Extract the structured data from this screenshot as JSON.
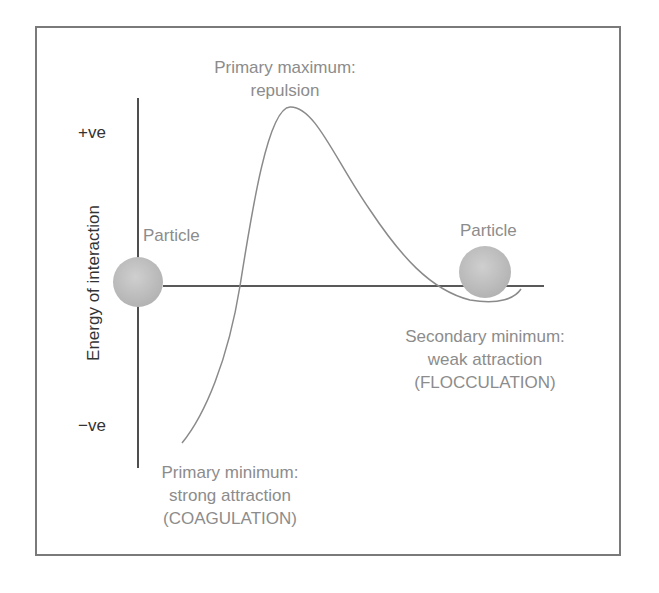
{
  "diagram": {
    "y_axis": {
      "label": "Energy of interaction",
      "top_label": "+ve",
      "bottom_label": "−ve"
    },
    "annotations": {
      "primary_maximum": [
        "Primary maximum:",
        "repulsion"
      ],
      "primary_minimum": [
        "Primary minimum:",
        "strong attraction",
        "(COAGULATION)"
      ],
      "secondary_minimum": [
        "Secondary minimum:",
        "weak attraction",
        "(FLOCCULATION)"
      ]
    },
    "particles": [
      {
        "label": "Particle",
        "position": "left"
      },
      {
        "label": "Particle",
        "position": "right"
      }
    ],
    "colors": {
      "frame": "#7a7a7a",
      "axis": "#222222",
      "curve": "#8a8a8a",
      "particle": "#bdbdbd",
      "annotation_text": "#8c8c8c",
      "axis_text": "#333333"
    }
  }
}
